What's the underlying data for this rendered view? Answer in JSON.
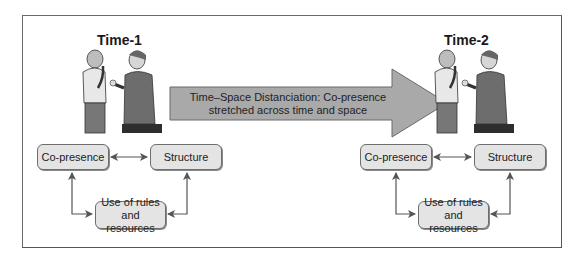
{
  "panels": [
    {
      "id": "time-1",
      "title": "Time-1",
      "boxes": {
        "co_presence": "Co-presence",
        "structure": "Structure",
        "rules_line1": "Use of rules",
        "rules_line2": "and resources"
      }
    },
    {
      "id": "time-2",
      "title": "Time-2",
      "boxes": {
        "co_presence": "Co-presence",
        "structure": "Structure",
        "rules_line1": "Use of rules",
        "rules_line2": "and resources"
      }
    }
  ],
  "arrow": {
    "line1": "Time–Space Distanciation: Co-presence",
    "line2": "stretched across time and space"
  },
  "colors": {
    "arrow_fill": "#a9a9a9",
    "box_fill": "#e4e4e4",
    "border": "#6a6a6a"
  }
}
